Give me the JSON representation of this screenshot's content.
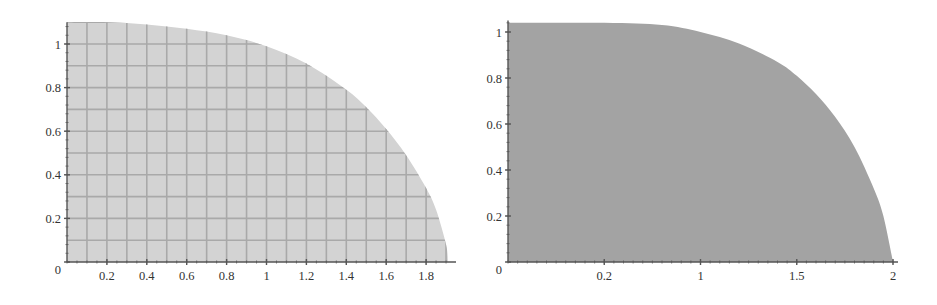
{
  "chart_data": [
    {
      "type": "area",
      "title": "",
      "xlabel": "",
      "ylabel": "",
      "description": "Filled quarter-region under a decreasing curve (light gray with grid overlay)",
      "fill_color": "#d3d3d3",
      "grid_color": "#a9a9a9",
      "grid": true,
      "xlim": [
        0,
        1.93
      ],
      "ylim": [
        0,
        1.1
      ],
      "x_ticks": [
        0.2,
        0.4,
        0.6,
        0.8,
        1,
        1.2,
        1.4,
        1.6,
        1.8
      ],
      "x_tick_labels": [
        "0.2",
        "0.4",
        "0.6",
        "0.8",
        "1",
        "1.2",
        "1.4",
        "1.6",
        "1.8"
      ],
      "y_ticks": [
        0,
        0.2,
        0.4,
        0.6,
        0.8,
        1
      ],
      "y_tick_labels": [
        "0",
        "0.2",
        "0.4",
        "0.6",
        "0.8",
        "1"
      ],
      "x": [
        0,
        0.2,
        0.4,
        0.6,
        0.8,
        1.0,
        1.2,
        1.4,
        1.5,
        1.6,
        1.7,
        1.8,
        1.85,
        1.9,
        1.91
      ],
      "y": [
        1.1,
        1.1,
        1.09,
        1.07,
        1.04,
        0.99,
        0.91,
        0.79,
        0.71,
        0.61,
        0.49,
        0.34,
        0.24,
        0.08,
        0.0
      ]
    },
    {
      "type": "area",
      "title": "",
      "xlabel": "",
      "ylabel": "",
      "description": "Filled quarter-region under a superellipse-like curve (solid darker gray, no grid)",
      "fill_color": "#a3a3a3",
      "grid": false,
      "xlim": [
        0,
        2.03
      ],
      "ylim": [
        0,
        1.05
      ],
      "x_tick_labels": [
        "0.2",
        "1",
        "1.5",
        "2"
      ],
      "x_tick_positions_fraction": [
        0.25,
        0.5,
        0.75,
        1.0
      ],
      "y_ticks": [
        0,
        0.2,
        0.4,
        0.6,
        0.8,
        1
      ],
      "y_tick_labels": [
        "0",
        "0.2",
        "0.4",
        "0.6",
        "0.8",
        "1"
      ],
      "x": [
        0,
        0.5,
        0.8,
        1.0,
        1.2,
        1.4,
        1.5,
        1.6,
        1.7,
        1.8,
        1.9,
        1.95,
        2.0
      ],
      "y": [
        1.04,
        1.04,
        1.03,
        1.0,
        0.95,
        0.87,
        0.81,
        0.73,
        0.63,
        0.5,
        0.32,
        0.2,
        0.0
      ]
    }
  ]
}
